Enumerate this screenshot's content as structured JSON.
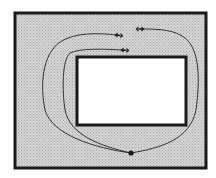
{
  "diagram": {
    "colors": {
      "background": "#ffffff",
      "outer_fill": "#c9c9c9",
      "inner_fill": "#ffffff",
      "stroke": "#1a1a1a"
    },
    "outer_rect": {
      "x": 15,
      "y": 13,
      "w": 191,
      "h": 155
    },
    "inner_rect": {
      "x": 77,
      "y": 57,
      "w": 109,
      "h": 68
    },
    "base_point": {
      "x": 131,
      "y": 153
    },
    "curves": [
      {
        "id": "outer-left-loop",
        "end": {
          "x": 118,
          "y": 35
        }
      },
      {
        "id": "inner-left-loop",
        "end": {
          "x": 124,
          "y": 50
        }
      },
      {
        "id": "right-loop",
        "end": {
          "x": 141,
          "y": 29
        }
      }
    ]
  }
}
